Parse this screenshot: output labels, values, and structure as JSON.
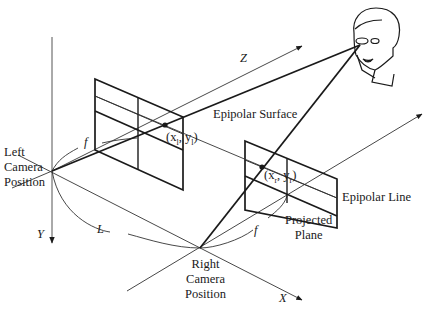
{
  "diagram": {
    "labels": {
      "left_camera": [
        "Left",
        "Camera",
        "Position"
      ],
      "right_camera": [
        "Right",
        "Camera",
        "Position"
      ],
      "epipolar_surface": "Epipolar Surface",
      "epipolar_line": "Epipolar Line",
      "projected_plane": [
        "Projected",
        "Plane"
      ],
      "axis_x": "X",
      "axis_y": "Y",
      "axis_z": "Z",
      "focal_left": "f",
      "focal_right": "f",
      "baseline": "L",
      "point_left": "(x_l, y_l)",
      "point_left_display": "(x",
      "point_left_sub": "l",
      "point_left_mid": ", y",
      "point_left_sub2": "l",
      "point_left_end": ")",
      "point_right_display": "(x",
      "point_right_sub": "r",
      "point_right_mid": ", y",
      "point_right_sub2": "r",
      "point_right_end": ")"
    },
    "colors": {
      "stroke": "#1a1a1a",
      "thin_stroke": "#444444",
      "background": "#ffffff"
    }
  }
}
